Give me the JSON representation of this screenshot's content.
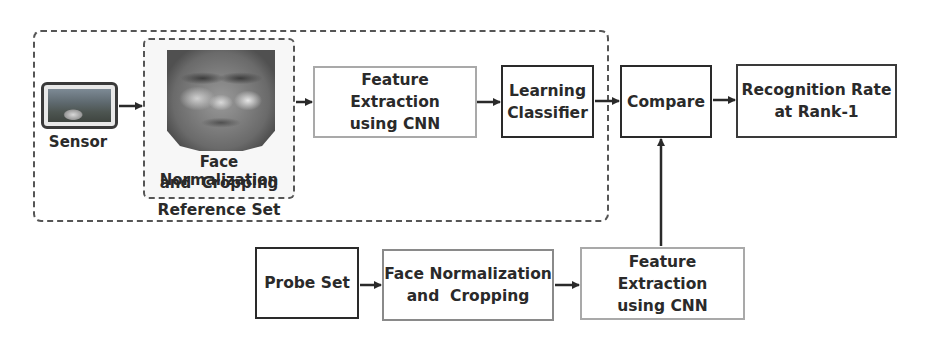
{
  "diagram": {
    "reference_set": {
      "label": "Reference Set",
      "sensor": {
        "label": "Sensor",
        "icon": "camera-image-icon"
      },
      "face_normalization": {
        "line1": "Face Normalization",
        "line2": "and  Cropping",
        "image": "face-image"
      },
      "feature_extraction": {
        "line1": "Feature Extraction",
        "line2": "using CNN"
      },
      "learning_classifier": {
        "line1": "Learning",
        "line2": "Classifier"
      }
    },
    "compare": {
      "label": "Compare"
    },
    "recognition_rate": {
      "line1": "Recognition Rate",
      "line2": "at Rank-1"
    },
    "probe_pipeline": {
      "probe_set": {
        "label": "Probe Set"
      },
      "face_normalization": {
        "line1": "Face Normalization",
        "line2": "and  Cropping"
      },
      "feature_extraction": {
        "line1": "Feature Extraction",
        "line2": "using CNN"
      }
    },
    "edges": [
      [
        "Sensor",
        "Face Normalization and Cropping"
      ],
      [
        "Face Normalization and Cropping",
        "Feature Extraction using CNN"
      ],
      [
        "Feature Extraction using CNN",
        "Learning Classifier"
      ],
      [
        "Learning Classifier",
        "Compare"
      ],
      [
        "Compare",
        "Recognition Rate at Rank-1"
      ],
      [
        "Probe Set",
        "Face Normalization and Cropping (probe)"
      ],
      [
        "Face Normalization and Cropping (probe)",
        "Feature Extraction using CNN (probe)"
      ],
      [
        "Feature Extraction using CNN (probe)",
        "Compare"
      ]
    ],
    "colors": {
      "dark_border": "#2a2a2a",
      "light_border": "#a9a9a9",
      "dashed": "#555555"
    }
  }
}
